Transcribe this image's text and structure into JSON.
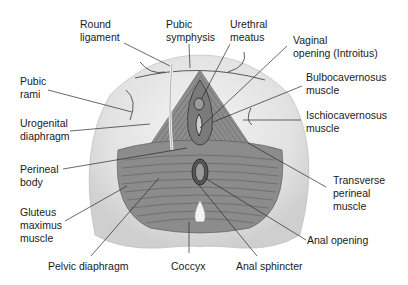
{
  "diagram": {
    "colors": {
      "background": "#ffffff",
      "outer_skin": "#d9d9d9",
      "inner_skin": "#eeeeee",
      "muscle": "#8a8a8a",
      "muscle_dark": "#6e6e6e",
      "line": "#2a2a2a",
      "text": "#1a1a1a"
    },
    "labels": {
      "round_ligament": [
        "Round",
        "ligament"
      ],
      "pubic_symphysis": [
        "Pubic",
        "symphysis"
      ],
      "urethral_meatus": [
        "Urethral",
        "meatus"
      ],
      "vaginal_opening": [
        "Vaginal",
        "opening (Introitus)"
      ],
      "pubic_rami": [
        "Pubic",
        "rami"
      ],
      "bulbocavernosus": [
        "Bulbocavernosus",
        "muscle"
      ],
      "urogenital_diaphragm": [
        "Urogenital",
        "diaphragm"
      ],
      "ischiocavernosus": [
        "Ischiocavernosus",
        "muscle"
      ],
      "perineal_body": [
        "Perineal",
        "body"
      ],
      "transverse_perineal": [
        "Transverse",
        "perineal",
        "muscle"
      ],
      "gluteus_maximus": [
        "Gluteus",
        "maximus",
        "muscle"
      ],
      "anal_opening": [
        "Anal opening"
      ],
      "pelvic_diaphragm": [
        "Pelvic diaphragm"
      ],
      "coccyx": [
        "Coccyx"
      ],
      "anal_sphincter": [
        "Anal sphincter"
      ]
    }
  }
}
